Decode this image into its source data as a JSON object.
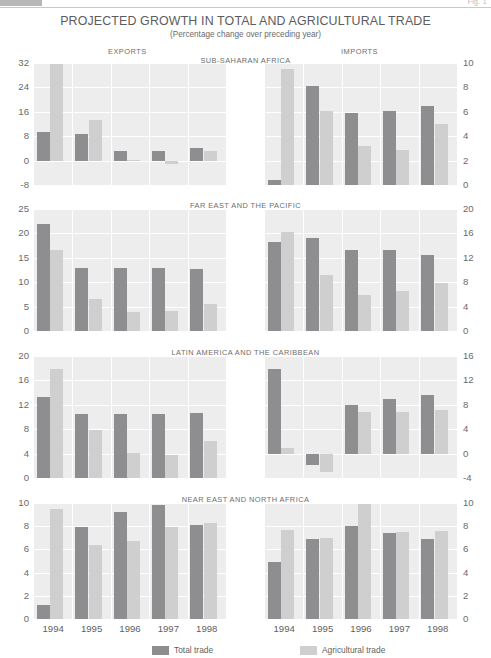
{
  "figure_label": "Fig. 1",
  "header": {
    "title": "PROJECTED GROWTH IN TOTAL AND AGRICULTURAL TRADE",
    "subtitle": "(Percentage change over preceding year)",
    "exports_label": "EXPORTS",
    "imports_label": "IMPORTS"
  },
  "legend": {
    "total_label": "Total trade",
    "agri_label": "Agricultural trade",
    "total_color": "#8e8e90",
    "agri_color": "#cfcfd0"
  },
  "regions": [
    "SUB-SAHARAN AFRICA",
    "FAR EAST AND THE PACIFIC",
    "LATIN AMERICA AND THE CARIBBEAN",
    "NEAR EAST AND NORTH AFRICA"
  ],
  "chart_data": [
    {
      "type": "bar",
      "title": "SUB-SAHARAN AFRICA",
      "panel": "EXPORTS",
      "xlabel": "",
      "ylabel": "",
      "categories": [
        "1994",
        "1995",
        "1996",
        "1997",
        "1998"
      ],
      "ylim": [
        -8,
        32
      ],
      "yticks": [
        -8,
        0,
        8,
        16,
        24,
        32
      ],
      "grid": true,
      "legend_position": "bottom",
      "series": [
        {
          "name": "Total trade",
          "values": [
            9.3,
            8.7,
            3.2,
            3.0,
            4.1
          ]
        },
        {
          "name": "Agricultural trade",
          "values": [
            31.6,
            13.2,
            0.3,
            -1.2,
            3.2
          ]
        }
      ]
    },
    {
      "type": "bar",
      "title": "SUB-SAHARAN AFRICA",
      "panel": "IMPORTS",
      "xlabel": "",
      "ylabel": "",
      "categories": [
        "1994",
        "1995",
        "1996",
        "1997",
        "1998"
      ],
      "ylim": [
        0,
        10
      ],
      "yticks": [
        0,
        2,
        4,
        6,
        8,
        10
      ],
      "grid": true,
      "legend_position": "bottom",
      "series": [
        {
          "name": "Total trade",
          "values": [
            0.4,
            8.1,
            5.9,
            6.1,
            6.5
          ]
        },
        {
          "name": "Agricultural trade",
          "values": [
            9.5,
            6.1,
            3.2,
            2.9,
            5.0
          ]
        }
      ]
    },
    {
      "type": "bar",
      "title": "FAR EAST AND THE PACIFIC",
      "panel": "EXPORTS",
      "xlabel": "",
      "ylabel": "",
      "categories": [
        "1994",
        "1995",
        "1996",
        "1997",
        "1998"
      ],
      "ylim": [
        0,
        25
      ],
      "yticks": [
        0,
        5,
        10,
        15,
        20,
        25
      ],
      "grid": true,
      "legend_position": "bottom",
      "series": [
        {
          "name": "Total trade",
          "values": [
            22.0,
            13.0,
            13.0,
            13.0,
            12.8
          ]
        },
        {
          "name": "Agricultural trade",
          "values": [
            16.6,
            6.6,
            3.9,
            4.2,
            5.5
          ]
        }
      ]
    },
    {
      "type": "bar",
      "title": "FAR EAST AND THE PACIFIC",
      "panel": "IMPORTS",
      "xlabel": "",
      "ylabel": "",
      "categories": [
        "1994",
        "1995",
        "1996",
        "1997",
        "1998"
      ],
      "ylim": [
        0,
        20
      ],
      "yticks": [
        0,
        4,
        8,
        12,
        16,
        20
      ],
      "grid": true,
      "legend_position": "bottom",
      "series": [
        {
          "name": "Total trade",
          "values": [
            14.6,
            15.3,
            13.3,
            13.3,
            12.4
          ]
        },
        {
          "name": "Agricultural trade",
          "values": [
            16.3,
            9.2,
            5.9,
            6.6,
            7.8
          ]
        }
      ]
    },
    {
      "type": "bar",
      "title": "LATIN AMERICA AND THE CARIBBEAN",
      "panel": "EXPORTS",
      "xlabel": "",
      "ylabel": "",
      "categories": [
        "1994",
        "1995",
        "1996",
        "1997",
        "1998"
      ],
      "ylim": [
        0,
        20
      ],
      "yticks": [
        0,
        4,
        8,
        12,
        16,
        20
      ],
      "grid": true,
      "legend_position": "bottom",
      "series": [
        {
          "name": "Total trade",
          "values": [
            13.2,
            10.5,
            10.5,
            10.5,
            10.6
          ]
        },
        {
          "name": "Agricultural trade",
          "values": [
            17.9,
            7.9,
            4.1,
            3.8,
            6.1
          ]
        }
      ]
    },
    {
      "type": "bar",
      "title": "LATIN AMERICA AND THE CARIBBEAN",
      "panel": "IMPORTS",
      "xlabel": "",
      "ylabel": "",
      "categories": [
        "1994",
        "1995",
        "1996",
        "1997",
        "1998"
      ],
      "ylim": [
        -4,
        16
      ],
      "yticks": [
        -4,
        0,
        4,
        8,
        12,
        16
      ],
      "grid": true,
      "legend_position": "bottom",
      "series": [
        {
          "name": "Total trade",
          "values": [
            13.8,
            -1.8,
            8.0,
            9.0,
            9.6
          ]
        },
        {
          "name": "Agricultural trade",
          "values": [
            1.0,
            -3.0,
            6.8,
            6.9,
            7.1
          ]
        }
      ]
    },
    {
      "type": "bar",
      "title": "NEAR EAST AND NORTH AFRICA",
      "panel": "EXPORTS",
      "xlabel": "",
      "ylabel": "",
      "categories": [
        "1994",
        "1995",
        "1996",
        "1997",
        "1998"
      ],
      "ylim": [
        0,
        10
      ],
      "yticks": [
        0,
        2,
        4,
        6,
        8,
        10
      ],
      "grid": true,
      "legend_position": "bottom",
      "series": [
        {
          "name": "Total trade",
          "values": [
            1.2,
            7.9,
            9.2,
            9.8,
            8.1
          ]
        },
        {
          "name": "Agricultural trade",
          "values": [
            9.5,
            6.4,
            6.7,
            7.9,
            8.3
          ]
        }
      ]
    },
    {
      "type": "bar",
      "title": "NEAR EAST AND NORTH AFRICA",
      "panel": "IMPORTS",
      "xlabel": "",
      "ylabel": "",
      "categories": [
        "1994",
        "1995",
        "1996",
        "1997",
        "1998"
      ],
      "ylim": [
        0,
        10
      ],
      "yticks": [
        0,
        2,
        4,
        6,
        8,
        10
      ],
      "grid": true,
      "legend_position": "bottom",
      "series": [
        {
          "name": "Total trade",
          "values": [
            4.9,
            6.9,
            8.0,
            7.4,
            6.9
          ]
        },
        {
          "name": "Agricultural trade",
          "values": [
            7.7,
            7.0,
            9.9,
            7.5,
            7.6
          ]
        }
      ]
    }
  ]
}
